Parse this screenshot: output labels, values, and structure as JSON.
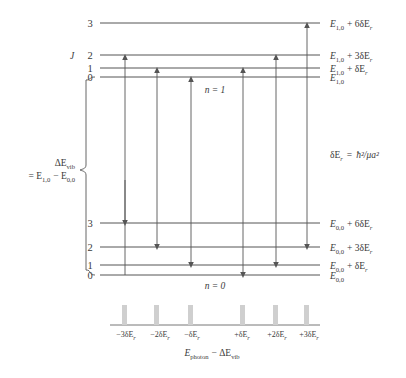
{
  "diagram": {
    "title_caption": "Rovibrational transition energy level diagram",
    "upper_manifold": {
      "state_label": "n = 1",
      "quantum_label": "J",
      "levels": [
        {
          "j": "3",
          "energy_base": "E",
          "energy_sub": "1,0",
          "energy_extra": "+ 6δE",
          "energy_extra_sub": "r"
        },
        {
          "j": "2",
          "energy_base": "E",
          "energy_sub": "1,0",
          "energy_extra": "+ 3δE",
          "energy_extra_sub": "r"
        },
        {
          "j": "1",
          "energy_base": "E",
          "energy_sub": "1,0",
          "energy_extra": "+ δE",
          "energy_extra_sub": "r"
        },
        {
          "j": "0",
          "energy_base": "E",
          "energy_sub": "1,0",
          "energy_extra": "",
          "energy_extra_sub": ""
        }
      ]
    },
    "lower_manifold": {
      "state_label": "n = 0",
      "levels": [
        {
          "j": "3",
          "energy_base": "E",
          "energy_sub": "0,0",
          "energy_extra": "+ 6δE",
          "energy_extra_sub": "r"
        },
        {
          "j": "2",
          "energy_base": "E",
          "energy_sub": "0,0",
          "energy_extra": "+ 3δE",
          "energy_extra_sub": "r"
        },
        {
          "j": "1",
          "energy_base": "E",
          "energy_sub": "0,0",
          "energy_extra": "+ δE",
          "energy_extra_sub": "r"
        },
        {
          "j": "0",
          "energy_base": "E",
          "energy_sub": "0,0",
          "energy_extra": "",
          "energy_extra_sub": ""
        }
      ]
    },
    "vib_bracket": {
      "line1_delta": "ΔE",
      "line1_sub": "vib",
      "line2_prefix": "= E",
      "line2_sub1": "1,0",
      "line2_minus": "− E",
      "line2_sub2": "0,0"
    },
    "rotational_constant": {
      "lhs_base": "δE",
      "lhs_sub": "r",
      "equals": "=",
      "rhs": "ħ²/μa²"
    },
    "transitions": [
      {
        "id": "t1",
        "from_level": "0",
        "to_level": "3",
        "branch": "P",
        "shift": "-3δE_r"
      },
      {
        "id": "t2",
        "from_level": "1",
        "to_level": "2",
        "branch": "P",
        "shift": "-2δE_r"
      },
      {
        "id": "t3",
        "from_level": "2",
        "to_level": "1",
        "branch": "P",
        "shift": "-δE_r"
      },
      {
        "id": "t4",
        "from_level": "1",
        "to_level": "0",
        "branch": "R",
        "shift": "+δE_r"
      },
      {
        "id": "t5",
        "from_level": "2",
        "to_level": "1",
        "branch": "R",
        "shift": "+2δE_r"
      },
      {
        "id": "t6",
        "from_level": "3",
        "to_level": "2",
        "branch": "R",
        "shift": "+3δE_r"
      }
    ],
    "spectrum": {
      "caption_base": "E",
      "caption_sub": "photon",
      "caption_minus": "− ΔE",
      "caption_sub2": "vib",
      "ticks": [
        {
          "prefix": "−3δE",
          "sub": "r"
        },
        {
          "prefix": "−2δE",
          "sub": "r"
        },
        {
          "prefix": "−δE",
          "sub": "r"
        },
        {
          "prefix": "+δE",
          "sub": "r"
        },
        {
          "prefix": "+2δE",
          "sub": "r"
        },
        {
          "prefix": "+3δE",
          "sub": "r"
        }
      ]
    },
    "colors": {
      "line": "#555555",
      "text": "#3a3a3a",
      "bar": "#cfcfcf",
      "background": "#ffffff"
    }
  }
}
